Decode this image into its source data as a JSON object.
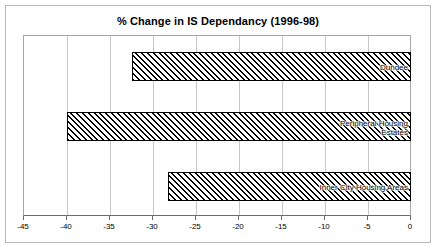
{
  "chart": {
    "title": "% Change in IS Dependancy (1996-98)"
  },
  "chart_data": {
    "type": "bar",
    "orientation": "horizontal",
    "title": "% Change in IS Dependancy (1996-98)",
    "xlabel": "",
    "ylabel": "",
    "xlim": [
      -45,
      0
    ],
    "xticks": [
      -45,
      -40,
      -35,
      -30,
      -25,
      -20,
      -15,
      -10,
      -5,
      0
    ],
    "xticklabels": [
      "-45",
      "-40",
      "-35",
      "-30",
      "-25",
      "-20",
      "-15",
      "-10",
      "-5",
      "0"
    ],
    "grid": true,
    "grid_axis": "x",
    "legend": false,
    "bar_fill": "diagonal-hatch",
    "categories": [
      "Dundee",
      "Peripheral Housing\nEstates",
      "Inner City Housing Areas"
    ],
    "values": [
      -32.4,
      -40.0,
      -28.3
    ],
    "bars": [
      {
        "label": "Dundee",
        "value": -32.4
      },
      {
        "label": "Peripheral Housing\nEstates",
        "value": -40.0
      },
      {
        "label": "Inner City Housing Areas",
        "value": -28.3
      }
    ]
  },
  "colors": {
    "frame_border": "#b9b9b9",
    "axis": "#6b6b6b",
    "gridline": "#c8c8c8",
    "bar_outline": "#000000",
    "background": "#ffffff"
  }
}
